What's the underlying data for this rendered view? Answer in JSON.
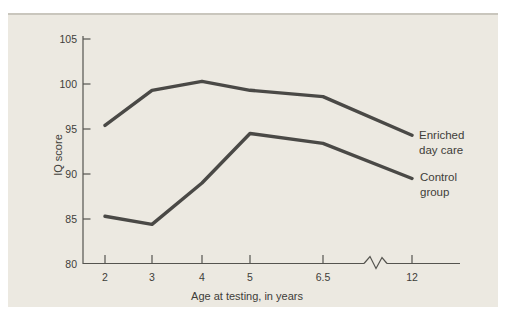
{
  "chart_data": {
    "type": "line",
    "title": "",
    "xlabel": "Age at testing, in years",
    "ylabel": "IQ score",
    "categories": [
      "2",
      "3",
      "4",
      "5",
      "6.5",
      "12"
    ],
    "x_values": [
      2,
      3,
      4,
      5,
      6.5,
      12
    ],
    "yticks": [
      80,
      85,
      90,
      95,
      100,
      105
    ],
    "ylim": [
      80,
      105
    ],
    "x_axis_break_between": [
      "6.5",
      "12"
    ],
    "grid": false,
    "legend_position": "right-of-line-ends",
    "series": [
      {
        "name": "Enriched day care",
        "values": [
          95.4,
          99.3,
          100.3,
          99.3,
          98.6,
          94.3
        ]
      },
      {
        "name": "Control group",
        "values": [
          85.3,
          84.4,
          89.0,
          94.5,
          93.4,
          89.5
        ]
      }
    ]
  },
  "colors": {
    "page_bg": "#ffffff",
    "panel_bg": "#ece9e1",
    "panel_edge": "#c9c6bd",
    "axis": "#55544f",
    "line": "#4a4946",
    "text": "#3e3d39"
  }
}
